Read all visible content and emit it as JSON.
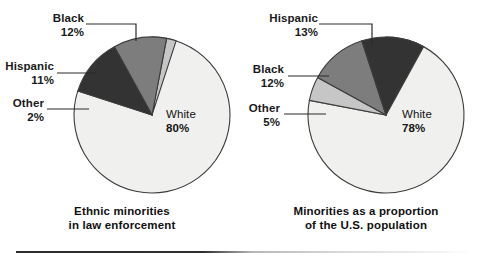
{
  "figure": {
    "width": 488,
    "height": 261,
    "background": "#ffffff"
  },
  "palette": {
    "white_slice": "#f0f0ee",
    "black_slice": "#333333",
    "hispanic_slice": "#7d7d7d",
    "other_slice": "#c6c6c6",
    "outline": "#3c3c3c",
    "text": "#111111",
    "rule": "#2b2b2b"
  },
  "chart_data": [
    {
      "type": "pie",
      "id": "law-enforcement",
      "title": "Ethnic minorities in law enforcement",
      "title_line1": "Ethnic minorities",
      "title_line2": "in law enforcement",
      "unit": "percent",
      "start_angle_deg": 0,
      "direction": "clockwise",
      "categories": [
        "White",
        "Black",
        "Hispanic",
        "Other"
      ],
      "values": [
        80,
        12,
        11,
        2
      ],
      "labels": [
        "White\n80%",
        "Black\n12%",
        "Hispanic\n11%",
        "Other\n2%"
      ],
      "slices": [
        {
          "name": "White",
          "value": 80,
          "pct_label": "80%",
          "color": "#f0f0ee",
          "label_placement": "inside"
        },
        {
          "name": "Black",
          "value": 12,
          "pct_label": "12%",
          "color": "#333333",
          "label_placement": "leader-top"
        },
        {
          "name": "Hispanic",
          "value": 11,
          "pct_label": "11%",
          "color": "#7d7d7d",
          "label_placement": "leader-left"
        },
        {
          "name": "Other",
          "value": 2,
          "pct_label": "2%",
          "color": "#c6c6c6",
          "label_placement": "leader-left"
        }
      ],
      "legend": "none",
      "grid": false
    },
    {
      "type": "pie",
      "id": "us-population",
      "title": "Minorities as a proportion of the U.S. population",
      "title_line1": "Minorities as a proportion",
      "title_line2": "of the U.S. population",
      "unit": "percent",
      "start_angle_deg": 0,
      "direction": "clockwise",
      "categories": [
        "White",
        "Hispanic",
        "Black",
        "Other"
      ],
      "values": [
        78,
        13,
        12,
        5
      ],
      "labels": [
        "White\n78%",
        "Hispanic\n13%",
        "Black\n12%",
        "Other\n5%"
      ],
      "slices": [
        {
          "name": "White",
          "value": 78,
          "pct_label": "78%",
          "color": "#f0f0ee",
          "label_placement": "inside"
        },
        {
          "name": "Hispanic",
          "value": 13,
          "pct_label": "13%",
          "color": "#333333",
          "label_placement": "leader-top"
        },
        {
          "name": "Black",
          "value": 12,
          "pct_label": "12%",
          "color": "#7d7d7d",
          "label_placement": "leader-left"
        },
        {
          "name": "Other",
          "value": 5,
          "pct_label": "5%",
          "color": "#c6c6c6",
          "label_placement": "leader-left"
        }
      ],
      "legend": "none",
      "grid": false
    }
  ],
  "left_chart": {
    "caption_line1": "Ethnic minorities",
    "caption_line2": "in law enforcement",
    "label_black_name": "Black",
    "label_black_pct": "12%",
    "label_hispanic_name": "Hispanic",
    "label_hispanic_pct": "11%",
    "label_other_name": "Other",
    "label_other_pct": "2%",
    "label_white_name": "White",
    "label_white_pct": "80%"
  },
  "right_chart": {
    "caption_line1": "Minorities as a proportion",
    "caption_line2": "of the U.S. population",
    "label_hispanic_name": "Hispanic",
    "label_hispanic_pct": "13%",
    "label_black_name": "Black",
    "label_black_pct": "12%",
    "label_other_name": "Other",
    "label_other_pct": "5%",
    "label_white_name": "White",
    "label_white_pct": "78%"
  }
}
